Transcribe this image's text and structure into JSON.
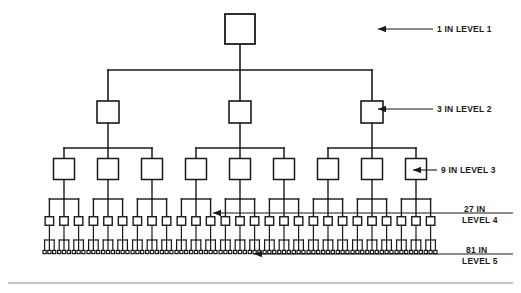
{
  "figure": {
    "title": "",
    "background_color": "#ffffff",
    "line_color": "#1a1a1a",
    "node_fill": "#ffffff"
  },
  "annotations": [
    {
      "id": "level1",
      "count": "1",
      "text": "1 IN LEVEL 1",
      "line1": "1 IN",
      "line2": "LEVEL 1",
      "two_line": false
    },
    {
      "id": "level2",
      "count": "3",
      "text": "3 IN LEVEL 2",
      "line1": "3 IN",
      "line2": "LEVEL 2",
      "two_line": false
    },
    {
      "id": "level3",
      "count": "9",
      "text": "9 IN LEVEL 3",
      "line1": "9 IN",
      "line2": "LEVEL 3",
      "two_line": false
    },
    {
      "id": "level4",
      "count": "27",
      "text": "27 IN LEVEL 4",
      "line1": "27 IN",
      "line2": "LEVEL 4",
      "two_line": true
    },
    {
      "id": "level5",
      "count": "81",
      "text": "81 IN LEVEL 5",
      "line1": "81 IN",
      "line2": "LEVEL 5",
      "two_line": true
    }
  ],
  "chart_data": {
    "type": "diagram",
    "subtype": "tree",
    "branching_factor": 3,
    "levels": [
      {
        "level": 1,
        "node_count": 1,
        "label": "1 IN LEVEL 1",
        "node_size_px": 30
      },
      {
        "level": 2,
        "node_count": 3,
        "label": "3 IN LEVEL 2",
        "node_size_px": 22
      },
      {
        "level": 3,
        "node_count": 9,
        "label": "9 IN LEVEL 3",
        "node_size_px": 21
      },
      {
        "level": 4,
        "node_count": 27,
        "label": "27 IN LEVEL 4",
        "node_size_px": 8
      },
      {
        "level": 5,
        "node_count": 81,
        "label": "81 IN LEVEL 5",
        "node_size_px": 3
      }
    ],
    "total_nodes": 121,
    "title": "",
    "xlabel": "",
    "ylabel": ""
  }
}
